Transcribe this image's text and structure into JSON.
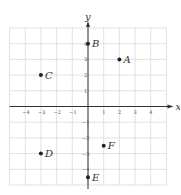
{
  "chart_data": {
    "type": "scatter",
    "title": "",
    "xlabel": "x",
    "ylabel": "y",
    "xlim": [
      -5,
      5
    ],
    "ylim": [
      -5,
      5
    ],
    "grid": true,
    "x_ticks": [
      -4,
      -3,
      -2,
      -1,
      1,
      2,
      3,
      4
    ],
    "y_ticks": [
      4,
      3,
      2,
      1,
      -1,
      -2,
      -3,
      -4
    ],
    "points": [
      {
        "label": "A",
        "x": 2,
        "y": 3
      },
      {
        "label": "B",
        "x": 0,
        "y": 4
      },
      {
        "label": "C",
        "x": -3,
        "y": 2
      },
      {
        "label": "D",
        "x": -3,
        "y": -3
      },
      {
        "label": "E",
        "x": 0,
        "y": -4.5
      },
      {
        "label": "F",
        "x": 1,
        "y": -2.5
      }
    ]
  },
  "colors": {
    "grid": "#d9d9d9",
    "axis": "#333333",
    "point": "#222222"
  }
}
